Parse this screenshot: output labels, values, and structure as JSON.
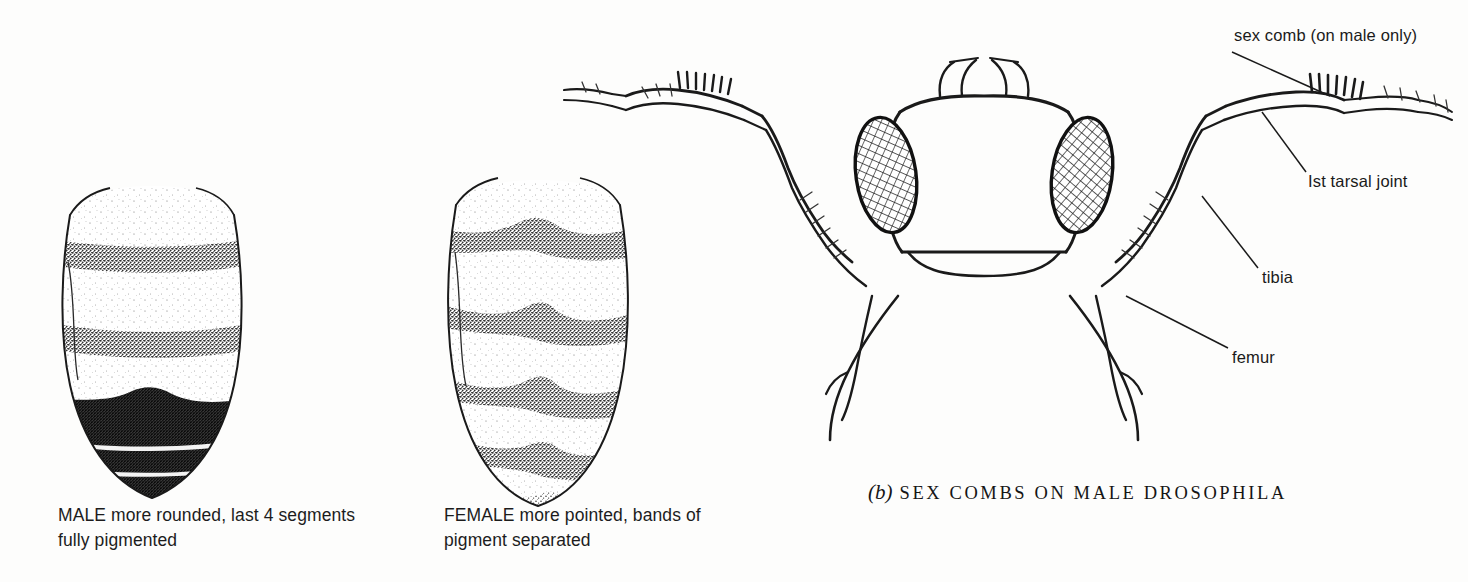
{
  "figure": {
    "domain": "scientific-illustration",
    "background_color": "#fdfdfc",
    "ink_color": "#1a1a1a"
  },
  "panels": [
    {
      "id": "male-abdomen",
      "name": "male abdomen drawing",
      "caption": "MALE more rounded, last 4 segments fully pigmented",
      "caption_lines": [
        "MALE more rounded, last 4 seg-",
        "ments fully pigmented"
      ],
      "band_count": 5,
      "tip_shape": "rounded",
      "pigment": "last 4 segments fused into solid dark mass"
    },
    {
      "id": "female-abdomen",
      "name": "female abdomen drawing",
      "caption": "FEMALE more pointed, bands of pigment separated",
      "caption_lines": [
        "FEMALE more pointed, bands of",
        "pigment separated"
      ],
      "band_count": 5,
      "tip_shape": "pointed",
      "pigment": "discrete separated bands with peaked centres"
    },
    {
      "id": "sex-comb-head",
      "name": "fly head and forelegs drawing",
      "caption_letter": "(b)",
      "caption_title": "SEX COMBS ON MALE DROSOPHILA",
      "eye_count": 2,
      "eye_pattern": "cross-hatched facets"
    }
  ],
  "labels": [
    {
      "id": "sex-comb",
      "text": "sex comb (on male only)"
    },
    {
      "id": "tarsal-joint",
      "text": "Ist tarsal joint"
    },
    {
      "id": "tibia",
      "text": "tibia"
    },
    {
      "id": "femur",
      "text": "femur"
    }
  ]
}
